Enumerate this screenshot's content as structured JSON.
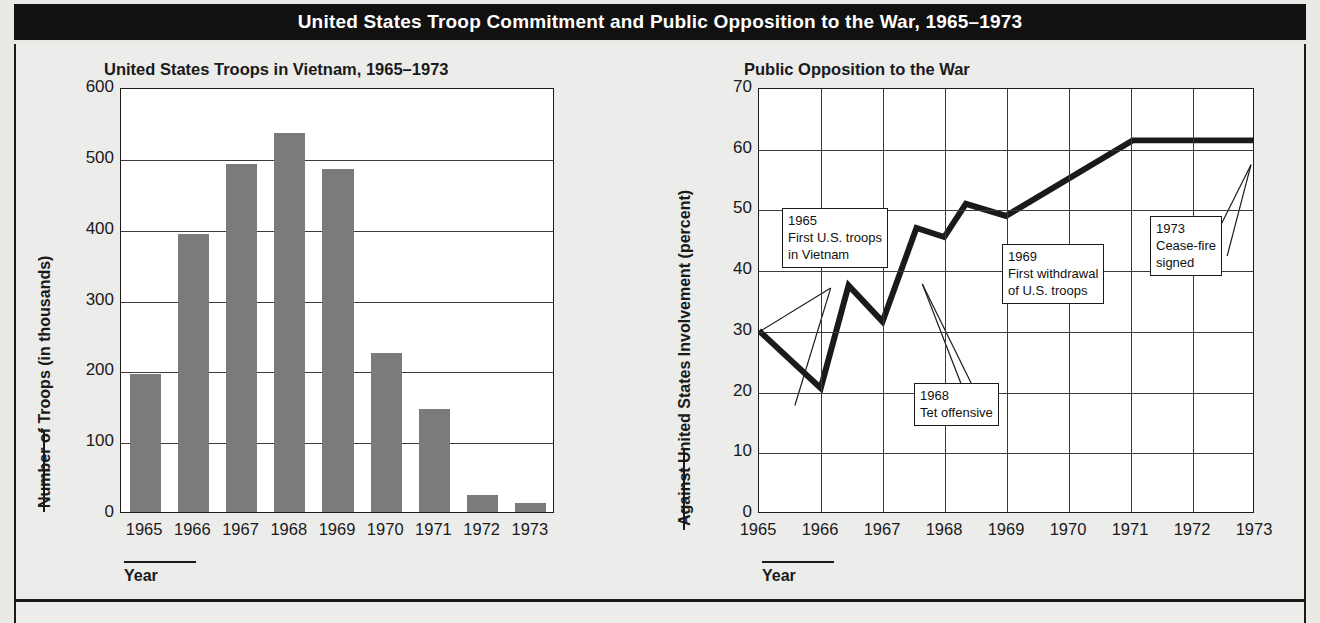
{
  "banner": {
    "title": "United States Troop Commitment and Public Opposition to the War, 1965–1973"
  },
  "caption": {
    "text": ""
  },
  "chart_data": [
    {
      "type": "bar",
      "title": "United States Troops in Vietnam, 1965–1973",
      "xlabel": "Year",
      "ylabel": "Number of Troops (in thousands)",
      "categories": [
        "1965",
        "1966",
        "1967",
        "1968",
        "1969",
        "1970",
        "1971",
        "1972",
        "1973"
      ],
      "values": [
        195,
        393,
        492,
        535,
        484,
        225,
        145,
        24,
        13
      ],
      "ylim": [
        0,
        600
      ],
      "yticks": [
        "0",
        "100",
        "200",
        "300",
        "400",
        "500",
        "600"
      ],
      "ytick_values": [
        0,
        100,
        200,
        300,
        400,
        500,
        600
      ],
      "grid": "horizontal",
      "legend": "none",
      "bar_color": "#7b7b7b"
    },
    {
      "type": "line",
      "title": "Public Opposition to the War",
      "xlabel": "Year",
      "ylabel": "Against United States Involvement (percent)",
      "categories": [
        "1965",
        "1966",
        "1967",
        "1968",
        "1969",
        "1970",
        "1971",
        "1972",
        "1973"
      ],
      "x": [
        1965.0,
        1966.0,
        1966.45,
        1967.0,
        1967.55,
        1968.0,
        1968.35,
        1969.0,
        1971.05,
        1973.0
      ],
      "values": [
        30,
        20.5,
        37.5,
        31.5,
        47,
        45.5,
        51,
        49,
        61.5,
        61.5
      ],
      "ylim": [
        0,
        70
      ],
      "xlim": [
        1965,
        1973
      ],
      "yticks": [
        "0",
        "10",
        "20",
        "30",
        "40",
        "50",
        "60",
        "70"
      ],
      "ytick_values": [
        0,
        10,
        20,
        30,
        40,
        50,
        60,
        70
      ],
      "grid": "both",
      "legend": "none",
      "line_color": "#1a1a1a",
      "annotations": [
        {
          "id": "1965",
          "year": "1965",
          "line1": "First U.S. troops",
          "line2": "in Vietnam"
        },
        {
          "id": "1968",
          "year": "1968",
          "line1": "Tet offensive",
          "line2": ""
        },
        {
          "id": "1969",
          "year": "1969",
          "line1": "First withdrawal",
          "line2": "of U.S. troops"
        },
        {
          "id": "1973",
          "year": "1973",
          "line1": "Cease-fire",
          "line2": "signed"
        }
      ]
    }
  ]
}
